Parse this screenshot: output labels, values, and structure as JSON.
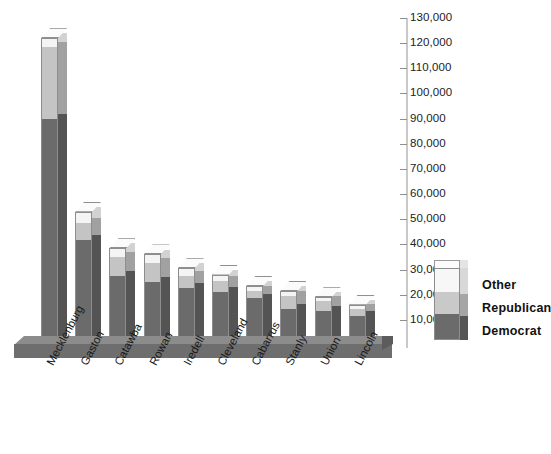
{
  "chart_data": {
    "type": "bar",
    "subtype": "stacked-3d-column",
    "title": "",
    "xlabel": "",
    "ylabel": "",
    "ylim": [
      0,
      130000
    ],
    "ytick_step": 10000,
    "grid": false,
    "legend_position": "right",
    "categories": [
      "Mecklenburg",
      "Gaston",
      "Catawba",
      "Rowan",
      "Iredell",
      "Cleveland",
      "Cabarrus",
      "Stanly",
      "Union",
      "Lincoln"
    ],
    "ytick_labels": [
      "10,000",
      "20,000",
      "30,000",
      "40,000",
      "50,000",
      "60,000",
      "70,000",
      "80,000",
      "90,000",
      "100,000",
      "110,000",
      "120,000",
      "130,000"
    ],
    "ytick_values": [
      10000,
      20000,
      30000,
      40000,
      50000,
      60000,
      70000,
      80000,
      90000,
      100000,
      110000,
      120000,
      130000
    ],
    "series": [
      {
        "name": "Democrat",
        "color": "#6b6b6b",
        "values": [
          90000,
          41800,
          27300,
          25000,
          22500,
          21000,
          18500,
          14500,
          13500,
          11500
        ]
      },
      {
        "name": "Republican",
        "color": "#c4c4c4",
        "values": [
          28500,
          6900,
          7700,
          7500,
          5000,
          4500,
          3000,
          5000,
          4000,
          3000
        ]
      },
      {
        "name": "Other",
        "color": "#f2f2f2",
        "values": [
          3500,
          4300,
          3500,
          3500,
          3000,
          2500,
          2000,
          2000,
          1500,
          1500
        ]
      }
    ],
    "totals": [
      122000,
      53000,
      38500,
      36000,
      30500,
      28000,
      23500,
      21500,
      19000,
      16000
    ]
  },
  "legend": {
    "items": [
      {
        "label": "Other",
        "color": "#f2f2f2"
      },
      {
        "label": "Republican",
        "color": "#c4c4c4"
      },
      {
        "label": "Democrat",
        "color": "#6b6b6b"
      }
    ]
  }
}
